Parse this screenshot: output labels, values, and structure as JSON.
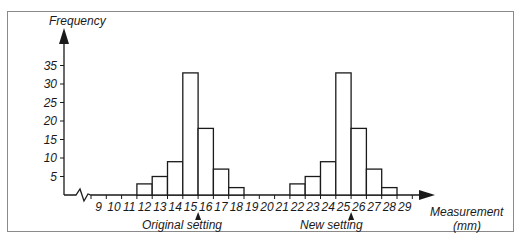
{
  "chart_data": {
    "type": "bar",
    "title": "",
    "ylabel": "Frequency",
    "xlabel": "Measurement (mm)",
    "xlabel_line1": "Measurement",
    "xlabel_line2": "(mm)",
    "ylim": [
      0,
      38
    ],
    "yticks": [
      5,
      10,
      15,
      20,
      25,
      30,
      35
    ],
    "xticks": [
      "9",
      "10",
      "11",
      "12",
      "13",
      "14",
      "15",
      "16",
      "17",
      "18",
      "19",
      "20",
      "21",
      "22",
      "23",
      "24",
      "25",
      "26",
      "27",
      "28",
      "29"
    ],
    "grid": false,
    "legend": null,
    "series": [
      {
        "name": "Original setting",
        "categories": [
          "12",
          "13",
          "14",
          "15",
          "16",
          "17",
          "18"
        ],
        "values": [
          3,
          5,
          9,
          33,
          18,
          7,
          2
        ]
      },
      {
        "name": "New setting",
        "categories": [
          "22",
          "23",
          "24",
          "25",
          "26",
          "27",
          "28"
        ],
        "values": [
          3,
          5,
          9,
          33,
          18,
          7,
          2
        ]
      }
    ],
    "annotations": [
      {
        "text": "Original setting",
        "at": "15"
      },
      {
        "text": "New setting",
        "at": "25"
      }
    ]
  },
  "labels": {
    "ylabel": "Frequency",
    "xlabel_line1": "Measurement",
    "xlabel_line2": "(mm)",
    "original": "Original setting",
    "new": "New setting"
  }
}
